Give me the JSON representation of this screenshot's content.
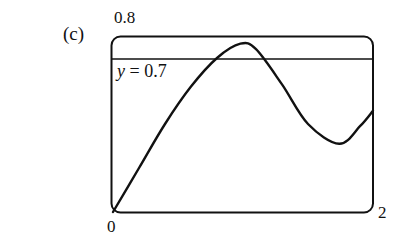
{
  "panel_label": "(c)",
  "chart_data": {
    "type": "line",
    "title": "",
    "xlabel": "",
    "ylabel": "",
    "xlim": [
      0,
      2
    ],
    "ylim": [
      0,
      0.8
    ],
    "tick_labels": {
      "x_min": "0",
      "x_max": "2",
      "y_max": "0.8"
    },
    "grid": false,
    "series": [
      {
        "name": "f(x)",
        "x": [
          0,
          0.2,
          0.4,
          0.6,
          0.8,
          0.98,
          1.1,
          1.3,
          1.5,
          1.74,
          1.9,
          2.0
        ],
        "y": [
          0,
          0.2,
          0.4,
          0.57,
          0.7,
          0.765,
          0.74,
          0.58,
          0.4,
          0.31,
          0.39,
          0.46
        ]
      },
      {
        "name": "y = 0.7",
        "x": [
          0,
          2
        ],
        "y": [
          0.7,
          0.7
        ]
      }
    ],
    "annotations": [
      "y = 0.7"
    ]
  }
}
